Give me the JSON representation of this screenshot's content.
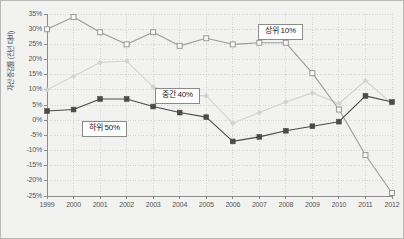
{
  "chart_data": {
    "type": "line",
    "title": "",
    "xlabel": "",
    "ylabel": "자산 증감률 (전년 대비)",
    "x": [
      1999,
      2000,
      2001,
      2002,
      2003,
      2004,
      2005,
      2006,
      2007,
      2008,
      2009,
      2010,
      2011,
      2012
    ],
    "xtick_labels": [
      "1999",
      "2000",
      "2001",
      "2002",
      "2003",
      "2004",
      "2005",
      "2006",
      "2007",
      "2008",
      "2009",
      "2010",
      "2011",
      "2012"
    ],
    "ylim": [
      -25,
      35
    ],
    "ytick_values": [
      35,
      30,
      25,
      20,
      15,
      10,
      5,
      0,
      -5,
      -10,
      -15,
      -20,
      -25
    ],
    "ytick_labels": [
      "35%",
      "30%",
      "25%",
      "20%",
      "15%",
      "10%",
      "5%",
      "0%",
      "-5%",
      "-10%",
      "-15%",
      "-20%",
      "-25%"
    ],
    "grid": true,
    "legend_position": "inline-callouts",
    "series": [
      {
        "name": "상위 10%",
        "color": "#9a9a98",
        "marker": "open-square",
        "values": [
          30,
          34,
          29,
          25,
          29,
          24.5,
          27,
          25,
          25.5,
          25.5,
          15.5,
          3.5,
          -11.5,
          -24
        ]
      },
      {
        "name": "중간 40%",
        "color": "#d2d2d0",
        "marker": "small-diamond",
        "values": [
          10,
          14.5,
          19,
          19.5,
          11,
          8.5,
          8,
          -1,
          2.5,
          6,
          9,
          5.5,
          13,
          5.5
        ]
      },
      {
        "name": "하위 50%",
        "color": "#4a4a4a",
        "marker": "filled-square",
        "values": [
          3,
          3.5,
          7,
          7,
          4.5,
          2.5,
          1,
          -7,
          -5.5,
          -3.5,
          -2,
          -0.5,
          8,
          6
        ]
      }
    ],
    "annotations": [
      {
        "text": "상위 10%",
        "series": "상위 10%"
      },
      {
        "text": "중간 40%",
        "series": "중간 40%"
      },
      {
        "text": "하위 50%",
        "series": "하위 50%"
      }
    ]
  },
  "style": {
    "background": "#f2f2f0",
    "frame_color": "#b8b8b6",
    "grid_color": "#c9c9c7",
    "axis_color": "#8c8c8a",
    "tick_text_color": "#555555"
  }
}
